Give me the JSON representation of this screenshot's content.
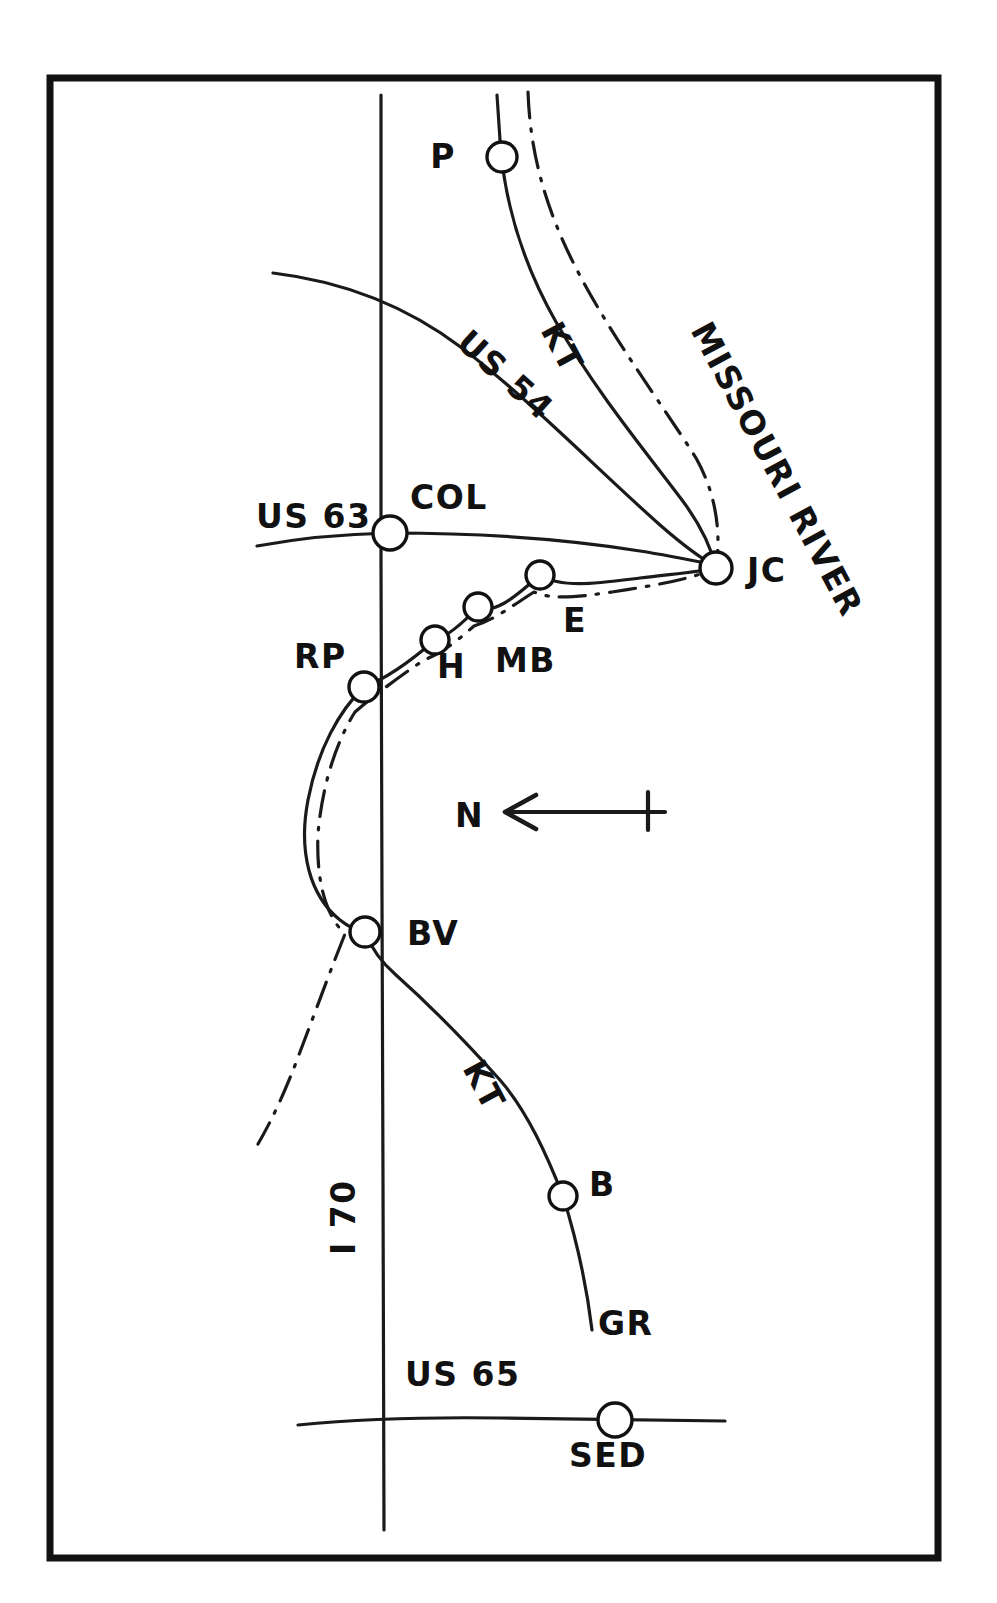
{
  "map": {
    "title": "Central Missouri Rail and Highway Sketch Map",
    "background_color": "#ffffff",
    "ink_color": "#111111",
    "frame": {
      "x": 50,
      "y": 78,
      "width": 888,
      "height": 1480,
      "stroke_width": 7
    },
    "compass": {
      "label": "N",
      "label_x": 455,
      "label_y": 827,
      "direction": "left",
      "arrow_tail_x": 665,
      "arrow_tip_x": 505,
      "arrow_y": 812,
      "tick_x": 648
    },
    "stations": [
      {
        "id": "P",
        "label": "P",
        "cx": 502,
        "cy": 157,
        "r": 15,
        "label_x": 443,
        "label_y": 168
      },
      {
        "id": "COL",
        "label": "COL",
        "cx": 390,
        "cy": 533,
        "r": 17,
        "label_x": 410,
        "label_y": 509
      },
      {
        "id": "JC",
        "label": "JC",
        "cx": 716,
        "cy": 568,
        "r": 16,
        "label_x": 747,
        "label_y": 582
      },
      {
        "id": "E",
        "label": "E",
        "cx": 540,
        "cy": 575,
        "r": 14,
        "label_x": 563,
        "label_y": 632
      },
      {
        "id": "MB",
        "label": "MB",
        "cx": 478,
        "cy": 607,
        "r": 14,
        "label_x": 495,
        "label_y": 672
      },
      {
        "id": "H",
        "label": "H",
        "cx": 435,
        "cy": 640,
        "r": 14,
        "label_x": 437,
        "label_y": 678
      },
      {
        "id": "RP",
        "label": "RP",
        "cx": 364,
        "cy": 687,
        "r": 15,
        "label_x": 294,
        "label_y": 668
      },
      {
        "id": "BV",
        "label": "BV",
        "cx": 365,
        "cy": 932,
        "r": 15,
        "label_x": 407,
        "label_y": 945
      },
      {
        "id": "B",
        "label": "B",
        "cx": 563,
        "cy": 1196,
        "r": 14,
        "label_x": 589,
        "label_y": 1196
      },
      {
        "id": "SED",
        "label": "SED",
        "cx": 615,
        "cy": 1420,
        "r": 17,
        "label_x": 608,
        "label_y": 1467
      }
    ],
    "route_labels": [
      {
        "id": "missouri-river",
        "text": "MISSOURI RIVER",
        "x": 690,
        "y": 330,
        "rotation": 62,
        "font_size": 33
      },
      {
        "id": "kt-north",
        "text": "KT",
        "x": 540,
        "y": 330,
        "rotation": 62,
        "font_size": 33
      },
      {
        "id": "us54",
        "text": "US 54",
        "x": 455,
        "y": 345,
        "rotation": 42,
        "font_size": 33
      },
      {
        "id": "us63",
        "text": "US 63",
        "x": 256,
        "y": 528,
        "rotation": 0,
        "font_size": 33
      },
      {
        "id": "kt-south",
        "text": "KT",
        "x": 462,
        "y": 1068,
        "rotation": 62,
        "font_size": 33
      },
      {
        "id": "i70",
        "text": "I 70",
        "x": 355,
        "y": 1255,
        "rotation": -90,
        "font_size": 33
      },
      {
        "id": "gr",
        "text": "GR",
        "x": 598,
        "y": 1335,
        "rotation": 0,
        "font_size": 33
      },
      {
        "id": "us65",
        "text": "US 65",
        "x": 405,
        "y": 1386,
        "rotation": 0,
        "font_size": 33
      }
    ],
    "routes": [
      {
        "id": "i70-highway",
        "name": "I 70",
        "kind": "highway",
        "style": "solid",
        "path": "M 381 95 L 381 560 L 382 900 L 383 1180 L 384 1530"
      },
      {
        "id": "us54-highway",
        "name": "US 54",
        "kind": "highway",
        "style": "solid",
        "path": "M 273 273 C 340 281 404 304 462 348 C 528 398 596 468 660 525 C 684 546 700 558 718 568"
      },
      {
        "id": "us63-highway",
        "name": "US 63",
        "kind": "highway",
        "style": "solid",
        "path": "M 257 546 C 300 538 345 534 390 533 C 470 533 560 538 640 551 C 672 556 700 562 730 568"
      },
      {
        "id": "us65-highway",
        "name": "US 65",
        "kind": "highway",
        "style": "solid",
        "path": "M 298 1425 C 360 1419 430 1417 500 1418 C 570 1419 660 1420 725 1421"
      },
      {
        "id": "kt-railroad",
        "name": "KT",
        "kind": "railroad",
        "style": "solid",
        "path": "M 497 95 L 500 140 C 504 200 522 262 556 322 C 596 392 646 452 682 500 C 703 528 712 551 716 568 C 700 572 672 574 640 578 C 600 583 562 589 540 575 C 512 600 494 614 478 607 C 462 624 448 636 435 640 C 412 660 388 678 364 687 C 340 710 318 748 308 800 C 298 852 310 896 340 920 C 350 928 357 931 365 932 C 372 950 382 963 396 975 C 424 1000 466 1042 500 1080 C 528 1112 548 1158 563 1196 C 576 1238 586 1280 592 1330"
      },
      {
        "id": "missouri-river",
        "name": "MISSOURI RIVER",
        "kind": "river",
        "style": "dash-dot",
        "path": "M 528 92 C 530 150 544 206 576 268 C 612 338 662 404 696 458 C 714 490 722 528 716 568 C 690 580 650 586 612 592 C 578 597 552 600 534 592 C 512 606 494 620 474 626 C 456 642 440 654 424 660 C 400 676 376 694 355 712 C 336 742 322 786 318 834 C 316 882 326 916 345 934 C 332 966 316 1010 300 1052 C 286 1090 272 1120 258 1144"
      }
    ]
  }
}
